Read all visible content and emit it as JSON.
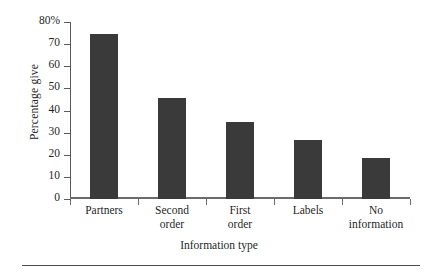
{
  "chart_data": {
    "type": "bar",
    "title": "",
    "categories": [
      "Partners",
      "Second order",
      "First order",
      "Labels",
      "No information"
    ],
    "category_lines": [
      [
        "Partners"
      ],
      [
        "Second",
        "order"
      ],
      [
        "First",
        "order"
      ],
      [
        "Labels"
      ],
      [
        "No",
        "information"
      ]
    ],
    "values": [
      74.5,
      45.5,
      35,
      26.5,
      18.5
    ],
    "xlabel": "Information type",
    "ylabel": "Percentage give",
    "ylim": [
      0,
      80
    ],
    "ytick_values": [
      0,
      10,
      20,
      30,
      40,
      50,
      60,
      70,
      80
    ],
    "ytick_labels": [
      "0",
      "10",
      "20",
      "30",
      "40",
      "50",
      "60",
      "70",
      "80%"
    ],
    "grid": false,
    "legend": null,
    "bar_color": "#3a3a3a",
    "axis_color": "#5a5a5a",
    "series": [
      {
        "name": "Percentage give",
        "values": [
          74.5,
          45.5,
          35,
          26.5,
          18.5
        ]
      }
    ]
  }
}
